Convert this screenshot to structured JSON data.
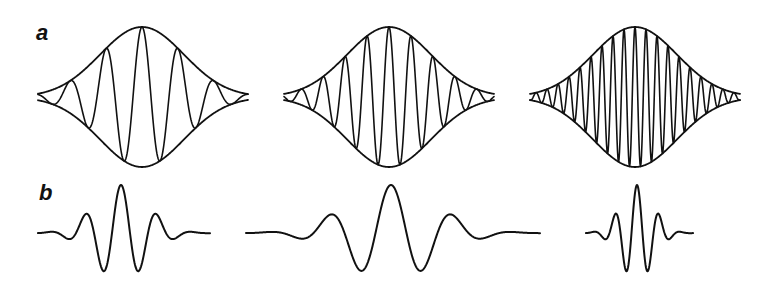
{
  "figure": {
    "panels": [
      {
        "label": "a",
        "description": "Gaussian-modulated carrier waves with envelope, increasing carrier frequency",
        "packets": [
          {
            "center_x": 142,
            "baseline_y": 97,
            "amplitude": 70,
            "sigma": 42,
            "period": 36,
            "x_start": 38,
            "x_end": 248,
            "show_envelope": true
          },
          {
            "center_x": 389,
            "baseline_y": 97,
            "amplitude": 70,
            "sigma": 42,
            "period": 22,
            "x_start": 284,
            "x_end": 494,
            "show_envelope": true
          },
          {
            "center_x": 635,
            "baseline_y": 97,
            "amplitude": 70,
            "sigma": 42,
            "period": 11,
            "x_start": 530,
            "x_end": 740,
            "show_envelope": true
          }
        ]
      },
      {
        "label": "b",
        "description": "Wavelets: Gaussian-windowed oscillations at different scales",
        "packets": [
          {
            "center_x": 121,
            "baseline_y": 233,
            "amplitude": 48,
            "sigma": 26,
            "period": 36,
            "x_start": 38,
            "x_end": 210,
            "show_envelope": false
          },
          {
            "center_x": 391,
            "baseline_y": 233,
            "amplitude": 48,
            "sigma": 44,
            "period": 62,
            "x_start": 246,
            "x_end": 540,
            "show_envelope": false
          },
          {
            "center_x": 637,
            "baseline_y": 233,
            "amplitude": 48,
            "sigma": 16,
            "period": 22,
            "x_start": 586,
            "x_end": 693,
            "show_envelope": false
          }
        ]
      }
    ],
    "colors": {
      "stroke": "#111111",
      "background": "#ffffff"
    }
  }
}
